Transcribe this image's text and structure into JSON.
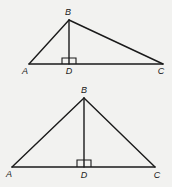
{
  "figures": [
    {
      "name": "top-triangle",
      "vertices": {
        "A": {
          "label": "A",
          "x": 29,
          "y": 64,
          "lx": 25,
          "ly": 74
        },
        "B": {
          "label": "B",
          "x": 69,
          "y": 20,
          "lx": 68,
          "ly": 15
        },
        "C": {
          "label": "C",
          "x": 163,
          "y": 64,
          "lx": 161,
          "ly": 74
        },
        "D": {
          "label": "D",
          "x": 69,
          "y": 64,
          "lx": 69,
          "ly": 74
        }
      },
      "right_angle_at": "D"
    },
    {
      "name": "bottom-triangle",
      "vertices": {
        "A": {
          "label": "A",
          "x": 12,
          "y": 167,
          "lx": 9,
          "ly": 177
        },
        "B": {
          "label": "B",
          "x": 84,
          "y": 98,
          "lx": 84,
          "ly": 93
        },
        "C": {
          "label": "C",
          "x": 155,
          "y": 167,
          "lx": 157,
          "ly": 178
        },
        "D": {
          "label": "D",
          "x": 84,
          "y": 167,
          "lx": 84,
          "ly": 178
        }
      },
      "right_angle_at": "D"
    }
  ],
  "labels": {
    "top": {
      "A": "A",
      "B": "B",
      "C": "C",
      "D": "D"
    },
    "bottom": {
      "A": "A",
      "B": "B",
      "C": "C",
      "D": "D"
    }
  }
}
